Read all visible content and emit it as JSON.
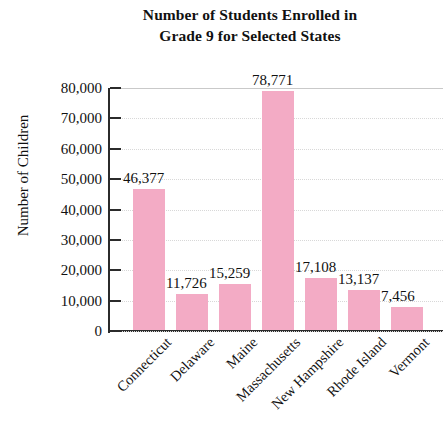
{
  "chart_data": {
    "type": "bar",
    "title": "Number of Students Enrolled in Grade 9 for Selected States",
    "title_lines": [
      "Number of Students Enrolled in",
      "Grade 9 for Selected States"
    ],
    "xlabel": "",
    "ylabel": "Number of Children",
    "ylim": [
      0,
      80000
    ],
    "grid": true,
    "legend": "none",
    "bar_color": "#f3abc5",
    "categories": [
      "Connecticut",
      "Delaware",
      "Maine",
      "Massachusetts",
      "New Hampshire",
      "Rhode Island",
      "Vermont"
    ],
    "values": [
      46377,
      11726,
      15259,
      78771,
      17108,
      13137,
      7456
    ],
    "value_labels": [
      "46,377",
      "11,726",
      "15,259",
      "78,771",
      "17,108",
      "13,137",
      "7,456"
    ],
    "ytick_values": [
      0,
      10000,
      20000,
      30000,
      40000,
      50000,
      60000,
      70000,
      80000
    ],
    "ytick_labels": [
      "0",
      "10,000",
      "20,000",
      "30,000",
      "40,000",
      "50,000",
      "60,000",
      "70,000",
      "80,000"
    ]
  }
}
